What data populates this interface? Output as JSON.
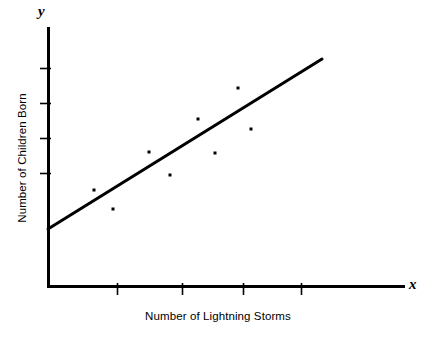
{
  "figure": {
    "background_color": "#ffffff",
    "ink_color": "#000000",
    "width": 427,
    "height": 340
  },
  "labels": {
    "y_variable": "y",
    "x_variable": "x",
    "x_axis_title": "Number of Lightning Storms",
    "y_axis_title": "Number of Children Born"
  },
  "chart_data": {
    "type": "scatter",
    "title": "",
    "xlabel": "Number of Lightning Storms",
    "ylabel": "Number of Children Born",
    "grid": false,
    "legend": null,
    "axis_variable_labels": {
      "x": "x",
      "y": "y"
    },
    "tick_labels": {
      "x": [],
      "y": []
    },
    "xlim": [
      0,
      10
    ],
    "ylim": [
      0,
      10
    ],
    "points": [
      {
        "x": 1.55,
        "y": 3.25
      },
      {
        "x": 2.15,
        "y": 2.57
      },
      {
        "x": 3.3,
        "y": 4.54
      },
      {
        "x": 4.0,
        "y": 3.76
      },
      {
        "x": 4.9,
        "y": 5.68
      },
      {
        "x": 5.45,
        "y": 4.51
      },
      {
        "x": 6.2,
        "y": 6.73
      },
      {
        "x": 6.6,
        "y": 5.34
      }
    ],
    "trendline": {
      "label": "line of best fit",
      "from": {
        "x": 0.0,
        "y": 1.93
      },
      "to": {
        "x": 8.85,
        "y": 7.7
      }
    },
    "ticks_pixels": {
      "x_axis_y": 286,
      "y_axis_x": 48,
      "x": [
        117,
        182,
        243,
        301
      ],
      "y": [
        68,
        103,
        138,
        173
      ]
    },
    "points_pixels": [
      {
        "x": 94,
        "y": 190
      },
      {
        "x": 113,
        "y": 209
      },
      {
        "x": 149,
        "y": 152
      },
      {
        "x": 170,
        "y": 175
      },
      {
        "x": 198,
        "y": 119
      },
      {
        "x": 215,
        "y": 153
      },
      {
        "x": 238,
        "y": 88
      },
      {
        "x": 251,
        "y": 129
      }
    ],
    "trendline_pixels": {
      "x1": 48,
      "y1": 229,
      "x2": 322,
      "y2": 59
    }
  }
}
